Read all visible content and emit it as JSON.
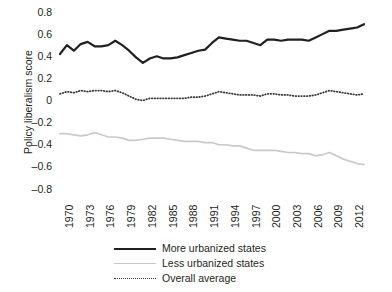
{
  "chart_data": {
    "type": "line",
    "title": "",
    "subtitle": "",
    "xlabel": "",
    "ylabel": "Policy liberalism score",
    "ylim": [
      -0.8,
      0.8
    ],
    "xlim": [
      1970,
      2014
    ],
    "yticks": [
      "0.8",
      "0.6",
      "0.4",
      "0.2",
      "0",
      "–0.2",
      "–0.4",
      "–0.6",
      "–0.8"
    ],
    "ytick_values": [
      0.8,
      0.6,
      0.4,
      0.2,
      0,
      -0.2,
      -0.4,
      -0.6,
      -0.8
    ],
    "xticks": [
      "1970",
      "1973",
      "1976",
      "1979",
      "1982",
      "1985",
      "1988",
      "1991",
      "1994",
      "1997",
      "2000",
      "2003",
      "2006",
      "2009",
      "2012"
    ],
    "xtick_values": [
      1970,
      1973,
      1976,
      1979,
      1982,
      1985,
      1988,
      1991,
      1994,
      1997,
      2000,
      2003,
      2006,
      2009,
      2012
    ],
    "grid": false,
    "legend_position": "bottom",
    "x": [
      1970,
      1971,
      1972,
      1973,
      1974,
      1975,
      1976,
      1977,
      1978,
      1979,
      1980,
      1981,
      1982,
      1983,
      1984,
      1985,
      1986,
      1987,
      1988,
      1989,
      1990,
      1991,
      1992,
      1993,
      1994,
      1995,
      1996,
      1997,
      1998,
      1999,
      2000,
      2001,
      2002,
      2003,
      2004,
      2005,
      2006,
      2007,
      2008,
      2009,
      2010,
      2011,
      2012,
      2013,
      2014
    ],
    "series": [
      {
        "name": "More urbanized states",
        "color": "#231f20",
        "style": "solid",
        "width": 2.2,
        "values": [
          0.42,
          0.5,
          0.45,
          0.51,
          0.53,
          0.49,
          0.49,
          0.5,
          0.54,
          0.5,
          0.45,
          0.39,
          0.34,
          0.38,
          0.4,
          0.38,
          0.38,
          0.39,
          0.41,
          0.43,
          0.45,
          0.46,
          0.52,
          0.57,
          0.56,
          0.55,
          0.54,
          0.54,
          0.52,
          0.5,
          0.55,
          0.55,
          0.54,
          0.55,
          0.55,
          0.55,
          0.54,
          0.57,
          0.6,
          0.63,
          0.63,
          0.64,
          0.65,
          0.66,
          0.69
        ]
      },
      {
        "name": "Less urbanized states",
        "color": "#c9c9c9",
        "style": "solid",
        "width": 1.7,
        "values": [
          -0.3,
          -0.3,
          -0.31,
          -0.32,
          -0.31,
          -0.29,
          -0.31,
          -0.33,
          -0.33,
          -0.34,
          -0.36,
          -0.36,
          -0.35,
          -0.34,
          -0.34,
          -0.34,
          -0.35,
          -0.36,
          -0.37,
          -0.37,
          -0.37,
          -0.38,
          -0.38,
          -0.4,
          -0.4,
          -0.41,
          -0.41,
          -0.43,
          -0.45,
          -0.45,
          -0.45,
          -0.45,
          -0.46,
          -0.47,
          -0.47,
          -0.48,
          -0.48,
          -0.5,
          -0.49,
          -0.47,
          -0.5,
          -0.53,
          -0.55,
          -0.57,
          -0.58
        ]
      },
      {
        "name": "Overall average",
        "color": "#3a3a3a",
        "style": "dotted",
        "width": 1.8,
        "values": [
          0.06,
          0.08,
          0.07,
          0.09,
          0.08,
          0.09,
          0.09,
          0.08,
          0.09,
          0.07,
          0.04,
          0.01,
          0.0,
          0.02,
          0.02,
          0.02,
          0.02,
          0.02,
          0.02,
          0.03,
          0.03,
          0.04,
          0.06,
          0.08,
          0.07,
          0.06,
          0.05,
          0.05,
          0.05,
          0.04,
          0.06,
          0.06,
          0.05,
          0.05,
          0.04,
          0.04,
          0.04,
          0.05,
          0.07,
          0.09,
          0.08,
          0.07,
          0.06,
          0.05,
          0.06
        ]
      }
    ]
  },
  "legend": {
    "items": [
      {
        "label": "More urbanized states"
      },
      {
        "label": "Less urbanized states"
      },
      {
        "label": "Overall average"
      }
    ]
  }
}
